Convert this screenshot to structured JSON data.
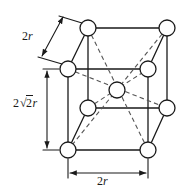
{
  "figure": {
    "name": "body-centered-cubic-unit-cell",
    "background_color": "#ffffff",
    "line_color": "#1a1a1a",
    "atom_fill_color": "#ffffff",
    "atom_stroke_color": "#1a1a1a"
  },
  "labels": {
    "edge": {
      "text": "2r",
      "coefficient": "2",
      "symbol": "r"
    },
    "height": {
      "text": "2√2 r",
      "coefficient": "2",
      "radical_sign": "√",
      "radicand": "2",
      "symbol": "r"
    },
    "base": {
      "text": "2r",
      "coefficient": "2",
      "symbol": "r"
    }
  },
  "atoms": [
    {
      "id": "back-top-left",
      "cx": 88,
      "cy": 28,
      "r": 8
    },
    {
      "id": "back-top-right",
      "cx": 167,
      "cy": 28,
      "r": 8
    },
    {
      "id": "front-top-left",
      "cx": 68,
      "cy": 69,
      "r": 8
    },
    {
      "id": "front-top-right",
      "cx": 148,
      "cy": 69,
      "r": 8
    },
    {
      "id": "body-center",
      "cx": 117,
      "cy": 90,
      "r": 8
    },
    {
      "id": "back-bottom-left",
      "cx": 88,
      "cy": 108,
      "r": 8
    },
    {
      "id": "back-bottom-right",
      "cx": 167,
      "cy": 108,
      "r": 8
    },
    {
      "id": "front-bottom-left",
      "cx": 68,
      "cy": 150,
      "r": 8
    },
    {
      "id": "front-bottom-right",
      "cx": 148,
      "cy": 150,
      "r": 8
    }
  ],
  "dimension_lines": {
    "edge_arrow": {
      "orientation": "diagonal",
      "double_headed": true
    },
    "height_arrow": {
      "orientation": "vertical",
      "double_headed": true
    },
    "base_arrow": {
      "orientation": "horizontal",
      "double_headed": true
    }
  }
}
